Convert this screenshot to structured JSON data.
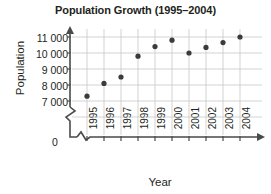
{
  "chart_data": {
    "type": "scatter",
    "title": "Population Growth (1995–2004)",
    "xlabel": "Year",
    "ylabel": "Population",
    "categories": [
      "1995",
      "1996",
      "1997",
      "1998",
      "1999",
      "2000",
      "2001",
      "2002",
      "2003",
      "2004"
    ],
    "x": [
      1995,
      1996,
      1997,
      1998,
      1999,
      2000,
      2001,
      2002,
      2003,
      2004
    ],
    "values": [
      7300,
      8100,
      8500,
      9800,
      10400,
      10800,
      10000,
      10350,
      10650,
      11000
    ],
    "series": [
      {
        "name": "Population",
        "values": [
          7300,
          8100,
          8500,
          9800,
          10400,
          10800,
          10000,
          10350,
          10650,
          11000
        ]
      }
    ],
    "ytick_labels": [
      "11 000",
      "10 000",
      "9 000",
      "8 000",
      "7 000"
    ],
    "ytick_values": [
      11000,
      10000,
      9000,
      8000,
      7000
    ],
    "ylim": [
      6600,
      11400
    ],
    "xlim": [
      1994.4,
      2004.6
    ],
    "origin_label": "0",
    "grid": true,
    "legend": "none",
    "axis_break_y": true,
    "axis_break_x": true,
    "marker_color": "#3b3b3b",
    "grid_color": "#c8c8c8",
    "axis_color": "#4a4a4a"
  }
}
